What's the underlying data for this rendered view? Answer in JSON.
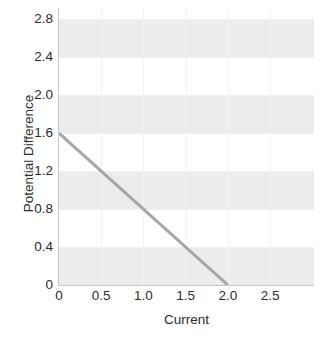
{
  "chart_data": {
    "type": "line",
    "title": "",
    "xlabel": "Current",
    "ylabel": "Potential Difference",
    "xlim": [
      0,
      3.02
    ],
    "ylim": [
      0,
      2.92
    ],
    "x_ticks": [
      0,
      0.5,
      1.0,
      1.5,
      2.0,
      2.5
    ],
    "x_tick_labels": [
      "0",
      "0.5",
      "1.0",
      "1.5",
      "2.0",
      "2.5"
    ],
    "y_ticks": [
      0,
      0.4,
      0.8,
      1.2,
      1.6,
      2.0,
      2.4,
      2.8
    ],
    "y_tick_labels": [
      "0",
      "0.4",
      "0.8",
      "1.2",
      "1.6",
      "2.0",
      "2.4",
      "2.8"
    ],
    "grid": true,
    "legend": false,
    "series": [
      {
        "name": "Potential Difference vs Current",
        "color": "#a6a6a6",
        "line_width": 3,
        "x": [
          0,
          2.0
        ],
        "values": [
          1.6,
          0
        ],
        "points": [
          [
            0,
            1.6
          ],
          [
            2.0,
            0
          ]
        ],
        "slope": -0.8,
        "intercept": 1.6
      }
    ],
    "bands": [
      {
        "from": 0,
        "to": 0.4,
        "color": "#ececec"
      },
      {
        "from": 0.8,
        "to": 1.2,
        "color": "#ececec"
      },
      {
        "from": 1.6,
        "to": 2.0,
        "color": "#ececec"
      },
      {
        "from": 2.4,
        "to": 2.8,
        "color": "#ececec"
      }
    ],
    "colors": {
      "background": "#ffffff",
      "band": "#ececec",
      "axis": "#c8c8c8",
      "gridline": "#f2f2f2",
      "tick_text": "#2b2b2b",
      "series_line": "#a6a6a6"
    }
  }
}
